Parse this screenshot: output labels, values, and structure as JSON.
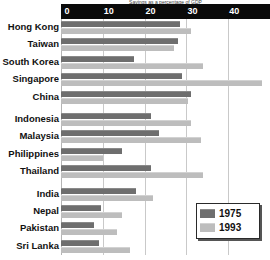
{
  "chart_data": {
    "type": "bar",
    "orientation": "horizontal",
    "title": "Savings as a percentage of GDP",
    "xlabel": "",
    "ylabel": "",
    "xlim": [
      0,
      50
    ],
    "xticks": [
      0,
      10,
      20,
      30,
      40,
      50
    ],
    "grid": true,
    "legend_position": "bottom-right",
    "categories": [
      "Hong Kong",
      "Taiwan",
      "South Korea",
      "Singapore",
      "China",
      "Indonesia",
      "Malaysia",
      "Philippines",
      "Thailand",
      "India",
      "Nepal",
      "Pakistan",
      "Sri Lanka"
    ],
    "series": [
      {
        "name": "1975",
        "color": "#6e6e6e",
        "values": [
          28.5,
          28.0,
          17.5,
          29.0,
          31.0,
          21.5,
          23.5,
          14.5,
          21.5,
          18.0,
          9.5,
          8.0,
          9.0
        ]
      },
      {
        "name": "1993",
        "color": "#bdbdbd",
        "values": [
          31.0,
          27.0,
          34.0,
          48.0,
          30.5,
          31.0,
          33.5,
          10.0,
          34.0,
          22.0,
          14.5,
          13.5,
          16.5
        ]
      }
    ]
  },
  "axis": {
    "tick_labels": [
      "0",
      "10",
      "20",
      "30",
      "40",
      "50"
    ]
  },
  "legend": {
    "entries": [
      {
        "label": "1975"
      },
      {
        "label": "1993"
      }
    ]
  },
  "colors": {
    "series_1975": "#6e6e6e",
    "series_1993": "#bdbdbd",
    "axis_background": "#0a0a0a",
    "axis_text": "#ffffff",
    "gridline": "#c9c9c9",
    "label_text": "#111111",
    "plot_background": "#ffffff"
  }
}
